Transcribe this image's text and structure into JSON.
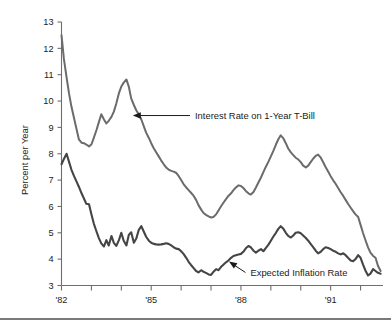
{
  "chart_data": {
    "type": "line",
    "title": "",
    "subtitle": "",
    "xlabel": "",
    "ylabel": "Percent per Year",
    "xlim": [
      1982.0,
      1992.75
    ],
    "ylim": [
      3,
      13
    ],
    "grid": false,
    "legend_position": "inline-annotations",
    "y_ticks": [
      3,
      4,
      5,
      6,
      7,
      8,
      9,
      10,
      11,
      12,
      13
    ],
    "y_tick_labels": [
      "3",
      "4",
      "5",
      "6",
      "7",
      "8",
      "9",
      "10",
      "11",
      "12",
      "13"
    ],
    "x_ticks": [
      1982,
      1983,
      1984,
      1985,
      1986,
      1987,
      1988,
      1989,
      1990,
      1991,
      1992
    ],
    "x_tick_labels": [
      "'82",
      "",
      "",
      "'85",
      "",
      "",
      "'88",
      "",
      "",
      "'91",
      ""
    ],
    "x_labeled_ticks": [
      "'82",
      "'85",
      "'88",
      "'91"
    ],
    "annotations": [
      {
        "text": "Interest Rate on 1-Year T-Bill",
        "series": "Interest Rate on 1-Year T-Bill",
        "points_to_x": 1984.35,
        "points_to_y": 9.45
      },
      {
        "text": "Expected Inflation Rate",
        "series": "Expected Inflation Rate",
        "points_to_x": 1987.55,
        "points_to_y": 3.95
      }
    ],
    "series": [
      {
        "name": "Interest Rate on 1-Year T-Bill",
        "color": "#6b6b6b",
        "x": [
          1982.0,
          1982.08,
          1982.17,
          1982.25,
          1982.33,
          1982.42,
          1982.5,
          1982.58,
          1982.67,
          1982.75,
          1982.83,
          1982.92,
          1983.0,
          1983.08,
          1983.17,
          1983.25,
          1983.33,
          1983.42,
          1983.5,
          1983.58,
          1983.67,
          1983.75,
          1983.83,
          1983.92,
          1984.0,
          1984.08,
          1984.17,
          1984.25,
          1984.33,
          1984.42,
          1984.5,
          1984.58,
          1984.67,
          1984.75,
          1984.83,
          1984.92,
          1985.0,
          1985.08,
          1985.17,
          1985.25,
          1985.33,
          1985.42,
          1985.5,
          1985.58,
          1985.67,
          1985.75,
          1985.83,
          1985.92,
          1986.0,
          1986.08,
          1986.17,
          1986.25,
          1986.33,
          1986.42,
          1986.5,
          1986.58,
          1986.67,
          1986.75,
          1986.83,
          1986.92,
          1987.0,
          1987.08,
          1987.17,
          1987.25,
          1987.33,
          1987.42,
          1987.5,
          1987.58,
          1987.67,
          1987.75,
          1987.83,
          1987.92,
          1988.0,
          1988.08,
          1988.17,
          1988.25,
          1988.33,
          1988.42,
          1988.5,
          1988.58,
          1988.67,
          1988.75,
          1988.83,
          1988.92,
          1989.0,
          1989.08,
          1989.17,
          1989.25,
          1989.33,
          1989.42,
          1989.5,
          1989.58,
          1989.67,
          1989.75,
          1989.83,
          1989.92,
          1990.0,
          1990.08,
          1990.17,
          1990.25,
          1990.33,
          1990.42,
          1990.5,
          1990.58,
          1990.67,
          1990.75,
          1990.83,
          1990.92,
          1991.0,
          1991.08,
          1991.17,
          1991.25,
          1991.33,
          1991.42,
          1991.5,
          1991.58,
          1991.67,
          1991.75,
          1991.83,
          1991.92,
          1992.0,
          1992.08,
          1992.17,
          1992.25,
          1992.33,
          1992.42,
          1992.5,
          1992.58,
          1992.67
        ],
        "y": [
          12.5,
          11.6,
          10.9,
          10.3,
          9.8,
          9.35,
          8.95,
          8.55,
          8.42,
          8.4,
          8.35,
          8.28,
          8.35,
          8.6,
          8.9,
          9.2,
          9.5,
          9.3,
          9.15,
          9.25,
          9.4,
          9.6,
          9.9,
          10.3,
          10.55,
          10.7,
          10.82,
          10.55,
          10.1,
          9.85,
          9.65,
          9.5,
          9.3,
          9.05,
          8.8,
          8.6,
          8.4,
          8.22,
          8.05,
          7.9,
          7.75,
          7.6,
          7.48,
          7.4,
          7.35,
          7.32,
          7.28,
          7.15,
          7.0,
          6.85,
          6.72,
          6.62,
          6.52,
          6.4,
          6.25,
          6.05,
          5.88,
          5.75,
          5.68,
          5.62,
          5.58,
          5.6,
          5.7,
          5.85,
          6.0,
          6.15,
          6.28,
          6.4,
          6.5,
          6.62,
          6.72,
          6.8,
          6.78,
          6.7,
          6.58,
          6.5,
          6.45,
          6.55,
          6.72,
          6.9,
          7.1,
          7.3,
          7.5,
          7.7,
          7.9,
          8.1,
          8.35,
          8.55,
          8.7,
          8.58,
          8.4,
          8.2,
          8.05,
          7.95,
          7.85,
          7.78,
          7.68,
          7.55,
          7.48,
          7.55,
          7.68,
          7.82,
          7.92,
          7.97,
          7.85,
          7.68,
          7.5,
          7.32,
          7.15,
          7.0,
          6.85,
          6.7,
          6.55,
          6.4,
          6.25,
          6.1,
          5.95,
          5.82,
          5.7,
          5.6,
          5.3,
          5.0,
          4.7,
          4.45,
          4.25,
          4.12,
          4.05,
          3.75,
          3.55
        ],
        "start_value": 12.5,
        "end_value": 3.55,
        "max_value": 10.82,
        "min_value": 3.55
      },
      {
        "name": "Expected Inflation Rate",
        "color": "#454545",
        "x": [
          1982.0,
          1982.08,
          1982.17,
          1982.25,
          1982.33,
          1982.42,
          1982.5,
          1982.58,
          1982.67,
          1982.75,
          1982.83,
          1982.92,
          1983.0,
          1983.08,
          1983.17,
          1983.25,
          1983.33,
          1983.42,
          1983.5,
          1983.58,
          1983.67,
          1983.75,
          1983.83,
          1983.92,
          1984.0,
          1984.08,
          1984.17,
          1984.25,
          1984.33,
          1984.42,
          1984.5,
          1984.58,
          1984.67,
          1984.75,
          1984.83,
          1984.92,
          1985.0,
          1985.08,
          1985.17,
          1985.25,
          1985.33,
          1985.42,
          1985.5,
          1985.58,
          1985.67,
          1985.75,
          1985.83,
          1985.92,
          1986.0,
          1986.08,
          1986.17,
          1986.25,
          1986.33,
          1986.42,
          1986.5,
          1986.58,
          1986.67,
          1986.75,
          1986.83,
          1986.92,
          1987.0,
          1987.08,
          1987.17,
          1987.25,
          1987.33,
          1987.42,
          1987.5,
          1987.58,
          1987.67,
          1987.75,
          1987.83,
          1987.92,
          1988.0,
          1988.08,
          1988.17,
          1988.25,
          1988.33,
          1988.42,
          1988.5,
          1988.58,
          1988.67,
          1988.75,
          1988.83,
          1988.92,
          1989.0,
          1989.08,
          1989.17,
          1989.25,
          1989.33,
          1989.42,
          1989.5,
          1989.58,
          1989.67,
          1989.75,
          1989.83,
          1989.92,
          1990.0,
          1990.08,
          1990.17,
          1990.25,
          1990.33,
          1990.42,
          1990.5,
          1990.58,
          1990.67,
          1990.75,
          1990.83,
          1990.92,
          1991.0,
          1991.08,
          1991.17,
          1991.25,
          1991.33,
          1991.42,
          1991.5,
          1991.58,
          1991.67,
          1991.75,
          1991.83,
          1991.92,
          1992.0,
          1992.08,
          1992.17,
          1992.25,
          1992.33,
          1992.42,
          1992.5,
          1992.58,
          1992.67
        ],
        "y": [
          7.6,
          7.8,
          8.0,
          7.7,
          7.4,
          7.15,
          6.95,
          6.75,
          6.5,
          6.3,
          6.1,
          6.08,
          5.7,
          5.35,
          5.05,
          4.8,
          4.6,
          4.48,
          4.72,
          4.52,
          4.88,
          4.62,
          4.5,
          4.72,
          5.0,
          4.7,
          4.52,
          4.92,
          5.02,
          4.62,
          4.78,
          5.1,
          5.25,
          5.05,
          4.85,
          4.7,
          4.62,
          4.58,
          4.56,
          4.55,
          4.56,
          4.58,
          4.6,
          4.58,
          4.52,
          4.45,
          4.4,
          4.38,
          4.3,
          4.2,
          4.05,
          3.9,
          3.78,
          3.66,
          3.55,
          3.5,
          3.58,
          3.52,
          3.48,
          3.42,
          3.4,
          3.52,
          3.62,
          3.58,
          3.7,
          3.8,
          3.88,
          3.95,
          4.05,
          4.12,
          4.15,
          4.18,
          4.2,
          4.28,
          4.42,
          4.5,
          4.45,
          4.32,
          4.25,
          4.32,
          4.38,
          4.3,
          4.42,
          4.55,
          4.7,
          4.85,
          5.0,
          5.15,
          5.25,
          5.15,
          5.0,
          4.88,
          4.82,
          4.9,
          5.0,
          5.02,
          4.98,
          4.9,
          4.8,
          4.7,
          4.58,
          4.45,
          4.32,
          4.22,
          4.28,
          4.38,
          4.45,
          4.42,
          4.38,
          4.32,
          4.28,
          4.22,
          4.18,
          4.22,
          4.15,
          4.05,
          3.95,
          3.92,
          4.0,
          4.15,
          4.05,
          3.8,
          3.55,
          3.38,
          3.45,
          3.62,
          3.55,
          3.48,
          3.45
        ],
        "start_value": 7.6,
        "end_value": 3.45,
        "max_value": 8.0,
        "min_value": 3.38
      }
    ]
  },
  "axis": {
    "y_title": "Percent per Year"
  },
  "colors": {
    "interest_rate_line": "#6b6b6b",
    "inflation_line": "#454545",
    "axis": "#6e6e6e",
    "text": "#1c1c1c",
    "footer_rule": "#7a7a7a",
    "background": "#ffffff"
  }
}
